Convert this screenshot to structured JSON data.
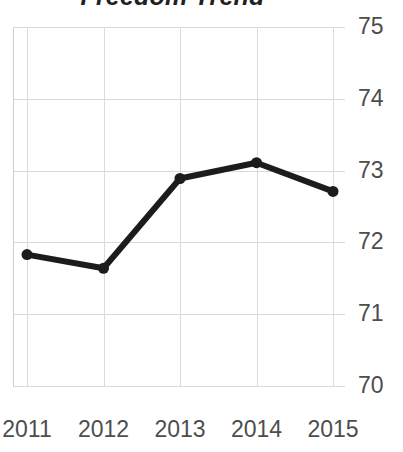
{
  "chart_data": {
    "type": "line",
    "title": "Freedom Trend",
    "xlabel": "",
    "ylabel": "",
    "categories": [
      "2011",
      "2012",
      "2013",
      "2014",
      "2015"
    ],
    "x": [
      2011,
      2012,
      2013,
      2014,
      2015
    ],
    "values": [
      71.83,
      71.64,
      72.89,
      73.11,
      72.71
    ],
    "series": [
      {
        "name": "Freedom Trend",
        "values": [
          71.83,
          71.64,
          72.89,
          73.11,
          72.71
        ]
      }
    ],
    "ylim": [
      70,
      75
    ],
    "yticks": [
      75,
      74,
      73,
      72,
      71,
      70
    ],
    "xticks": [
      "2011",
      "2012",
      "2013",
      "2014",
      "2015"
    ],
    "grid": true,
    "legend": "none",
    "line_color": "#1c1c1c",
    "marker": "circle",
    "marker_color": "#1c1c1c",
    "grid_color": "#d9d9d9",
    "tick_label_color": "#4d4d4d",
    "title_color": "#231f20",
    "background_color": "#ffffff"
  }
}
